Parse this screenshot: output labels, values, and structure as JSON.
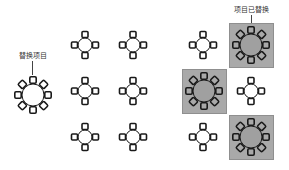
{
  "diagram": {
    "source_label": "替换项目",
    "result_label": "项目已替换",
    "colors": {
      "background": "#ffffff",
      "stroke": "#1a1a1a",
      "highlight_box": "#a9a9a9",
      "highlight_table_fill": "#a0a0a0",
      "label_text": "#333333"
    },
    "source_item": {
      "type": "round-table-8-seats",
      "cx": 33,
      "cy": 95
    },
    "left_grid": {
      "caption": "",
      "tables": [
        {
          "type": "round-table-4-seats",
          "cx": 85,
          "cy": 45
        },
        {
          "type": "round-table-4-seats",
          "cx": 133,
          "cy": 45
        },
        {
          "type": "round-table-4-seats",
          "cx": 85,
          "cy": 91
        },
        {
          "type": "round-table-4-seats",
          "cx": 133,
          "cy": 91
        },
        {
          "type": "round-table-4-seats",
          "cx": 85,
          "cy": 137
        },
        {
          "type": "round-table-4-seats",
          "cx": 133,
          "cy": 137
        }
      ]
    },
    "right_grid": {
      "tables": [
        {
          "type": "round-table-4-seats",
          "cx": 203,
          "cy": 45,
          "replaced": false
        },
        {
          "type": "round-table-8-seats",
          "cx": 251,
          "cy": 45,
          "replaced": true
        },
        {
          "type": "round-table-8-seats",
          "cx": 204,
          "cy": 91,
          "replaced": true
        },
        {
          "type": "round-table-4-seats",
          "cx": 251,
          "cy": 91,
          "replaced": false
        },
        {
          "type": "round-table-4-seats",
          "cx": 203,
          "cy": 137,
          "replaced": false
        },
        {
          "type": "round-table-8-seats",
          "cx": 251,
          "cy": 137,
          "replaced": true
        }
      ]
    }
  }
}
